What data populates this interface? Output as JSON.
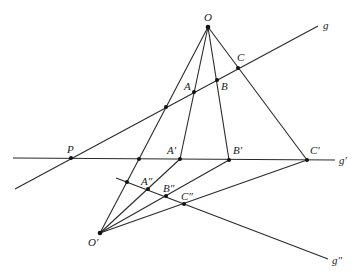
{
  "diagram": {
    "points": {
      "O": {
        "label": "O",
        "x": 208,
        "y": 27
      },
      "A": {
        "label": "A",
        "x": 194,
        "y": 92
      },
      "B": {
        "label": "B",
        "x": 217,
        "y": 80
      },
      "C": {
        "label": "C",
        "x": 238,
        "y": 68
      },
      "G0": {
        "label": "",
        "x": 166,
        "y": 107
      },
      "P": {
        "label": "P",
        "x": 71,
        "y": 158
      },
      "X0": {
        "label": "",
        "x": 139,
        "y": 159
      },
      "A1": {
        "label": "A′",
        "x": 180,
        "y": 159
      },
      "B1": {
        "label": "B′",
        "x": 229,
        "y": 160
      },
      "C1": {
        "label": "C′",
        "x": 307,
        "y": 160
      },
      "O1": {
        "label": "O′",
        "x": 100,
        "y": 233
      },
      "Y0": {
        "label": "",
        "x": 127,
        "y": 182
      },
      "A2": {
        "label": "A″",
        "x": 148,
        "y": 189
      },
      "B2": {
        "label": "B″",
        "x": 166,
        "y": 196
      },
      "C2": {
        "label": "C″",
        "x": 184,
        "y": 204
      }
    },
    "lines": {
      "g": {
        "label": "g",
        "x1": 15,
        "y1": 189,
        "x2": 318,
        "y2": 26
      },
      "g1": {
        "label": "g′",
        "x1": 13,
        "y1": 158,
        "x2": 335,
        "y2": 160
      },
      "g2": {
        "label": "g″",
        "x1": 116,
        "y1": 178,
        "x2": 328,
        "y2": 259
      }
    },
    "labels": {
      "O": "O",
      "A": "A",
      "B": "B",
      "C": "C",
      "P": "P",
      "A1": "A′",
      "B1": "B′",
      "C1": "C′",
      "O1": "O′",
      "A2": "A″",
      "B2": "B″",
      "C2": "C″",
      "g": "g",
      "g1": "g′",
      "g2": "g″"
    }
  }
}
